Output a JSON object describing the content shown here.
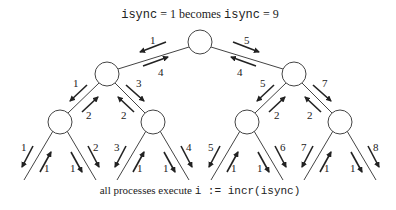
{
  "title": {
    "var1": "isync",
    "eq1": " = 1 becomes ",
    "var2": "isync",
    "eq2": " = 9"
  },
  "caption": {
    "prefix": "all processes execute ",
    "code": "i := incr(isync)"
  },
  "tree": {
    "nodes": [
      {
        "id": "root",
        "x": 200,
        "y": 42
      },
      {
        "id": "l1-left",
        "x": 107,
        "y": 74
      },
      {
        "id": "l1-right",
        "x": 294,
        "y": 74
      },
      {
        "id": "l2-0",
        "x": 60,
        "y": 122
      },
      {
        "id": "l2-1",
        "x": 153,
        "y": 122
      },
      {
        "id": "l2-2",
        "x": 247,
        "y": 122
      },
      {
        "id": "l2-3",
        "x": 340,
        "y": 122
      }
    ],
    "edge_labels": {
      "root_left_down": "1",
      "root_left_up": "4",
      "root_right_down": "5",
      "root_right_up": "4",
      "l1l_left_down": "1",
      "l1l_left_up": "2",
      "l1l_right_down": "3",
      "l1l_right_up": "2",
      "l1r_left_down": "5",
      "l1r_left_up": "2",
      "l1r_right_down": "7",
      "l1r_right_up": "2",
      "leaf_down": [
        "1",
        "2",
        "3",
        "4",
        "5",
        "6",
        "7",
        "8"
      ],
      "leaf_up": [
        "1",
        "1",
        "1",
        "1",
        "1",
        "1",
        "1",
        "1"
      ]
    }
  }
}
